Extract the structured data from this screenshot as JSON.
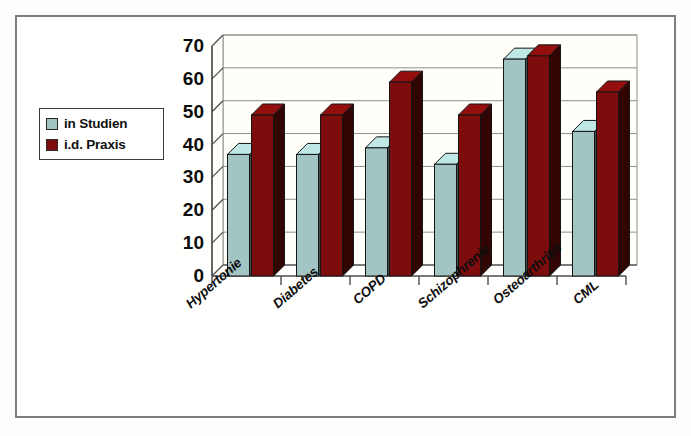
{
  "chart_data": {
    "type": "bar",
    "title": "",
    "subtitle": "",
    "xlabel": "",
    "ylabel": "",
    "categories": [
      "Hypertonie",
      "Diabetes",
      "COPD",
      "Schizophrenie",
      "Osteoarthritis",
      "CML"
    ],
    "series": [
      {
        "name": "in Studien",
        "color": "#a2c4c3",
        "values": [
          37,
          37,
          39,
          34,
          66,
          44
        ]
      },
      {
        "name": "i.d. Praxis",
        "color": "#7d0c0c",
        "values": [
          49,
          49,
          59,
          49,
          67,
          56
        ]
      }
    ],
    "ylim": [
      0,
      70
    ],
    "yticks": [
      0,
      10,
      20,
      30,
      40,
      50,
      60,
      70
    ],
    "ytick_labels": [
      "0",
      "10",
      "20",
      "30",
      "40",
      "50",
      "60",
      "70"
    ],
    "grid": true,
    "grid_axis": "y",
    "legend_position": "left",
    "style": "3d-column",
    "annotations": []
  },
  "legend": {
    "items": [
      {
        "label": "in Studien",
        "swatch_color": "#a2c4c3",
        "icon": "square-swatch-icon"
      },
      {
        "label": "i.d. Praxis",
        "swatch_color": "#7d0c0c",
        "icon": "square-swatch-icon"
      }
    ]
  },
  "colors": {
    "series_studien": "#a2c4c3",
    "series_praxis": "#7d0c0c",
    "axis": "#4d4d4d",
    "grid": "#8f8f8f",
    "frame": "#7e7e7e",
    "text": "#0d0d0d",
    "plot_background": "#fffef8",
    "floor": "#3d3d3d"
  }
}
